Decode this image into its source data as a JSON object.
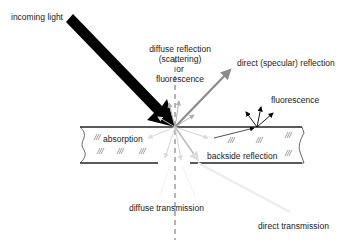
{
  "diagram": {
    "colors": {
      "incoming_arrow": "#000000",
      "specular_arrow": "#8c8c8c",
      "diffuse_arrows": "#b0b0b0",
      "faint_arrows": "#e0e0e0",
      "plate_border": "#222222",
      "normal_line": "#444444"
    },
    "labels": {
      "incoming_light": "incoming light",
      "diffuse_reflection_line1": "diffuse reflection",
      "diffuse_reflection_line2": "(scattering)",
      "diffuse_reflection_line3": "or",
      "diffuse_reflection_line4": "fluorescence",
      "direct_reflection": "direct (specular) reflection",
      "fluorescence": "fluorescence",
      "absorption": "absorption",
      "backside_reflection": "backside reflection",
      "diffuse_transmission": "diffuse transmission",
      "direct_transmission": "direct transmission"
    },
    "nodes": [
      {
        "id": "incoming",
        "label": "incoming light"
      },
      {
        "id": "diffuse_reflection",
        "label": "diffuse reflection (scattering) or fluorescence"
      },
      {
        "id": "specular",
        "label": "direct (specular) reflection"
      },
      {
        "id": "fluorescence",
        "label": "fluorescence"
      },
      {
        "id": "absorption",
        "label": "absorption"
      },
      {
        "id": "backside",
        "label": "backside reflection"
      },
      {
        "id": "diffuse_transmission",
        "label": "diffuse transmission"
      },
      {
        "id": "direct_transmission",
        "label": "direct transmission"
      }
    ]
  }
}
